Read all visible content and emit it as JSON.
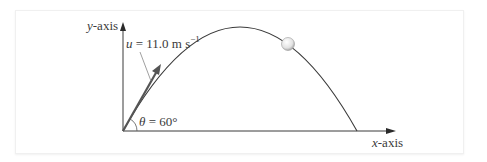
{
  "diagram": {
    "type": "projectile-motion",
    "axes": {
      "x_label": "x-axis",
      "y_label": "y-axis"
    },
    "launch": {
      "velocity_symbol": "u",
      "velocity_value": "11.0",
      "velocity_unit": "m s",
      "velocity_unit_exponent": "−1",
      "angle_symbol": "θ",
      "angle_value": "60°"
    },
    "labels": {
      "velocity_prefix": "u",
      "velocity_eq": " = 11.0 m s",
      "velocity_exp": "−1",
      "angle_prefix": "θ",
      "angle_eq": " = 60°"
    },
    "elements": [
      "trajectory",
      "ball",
      "velocity-vector",
      "angle-arc"
    ],
    "colors": {
      "line": "#3a3a3a",
      "ball_fill": "#e6e6e6",
      "frame_border": "#f0f0f0"
    }
  }
}
